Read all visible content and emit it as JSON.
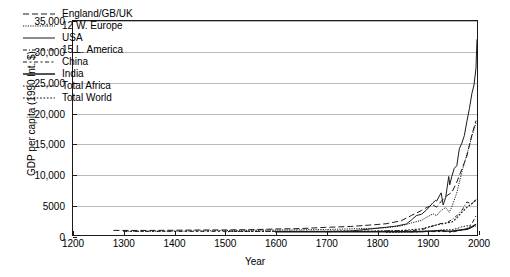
{
  "chart_data": {
    "type": "line",
    "title": "",
    "xlabel": "Year",
    "ylabel": "GDP per capita (1990 Int. $)",
    "xlim": [
      1200,
      2000
    ],
    "ylim": [
      0,
      35000
    ],
    "xticks": [
      1200,
      1300,
      1400,
      1500,
      1600,
      1700,
      1800,
      1900,
      2000
    ],
    "xticklabels": [
      "1200",
      "1300",
      "1400",
      "1500",
      "1600",
      "1700",
      "1800",
      "1900",
      "2000"
    ],
    "yticks": [
      0,
      5000,
      10000,
      15000,
      20000,
      25000,
      30000,
      35000
    ],
    "yticklabels": [
      "0",
      "5000",
      "10,000",
      "15,000",
      "20,000",
      "25,000",
      "30,000",
      "35,000"
    ],
    "grid": "horizontal",
    "legend_position": "top-left",
    "series": [
      {
        "name": "England/GB/UK",
        "style": "dashed",
        "x": [
          1280,
          1350,
          1400,
          1450,
          1500,
          1550,
          1600,
          1650,
          1700,
          1750,
          1800,
          1820,
          1850,
          1870,
          1890,
          1900,
          1913,
          1920,
          1929,
          1938,
          1945,
          1950,
          1960,
          1970,
          1980,
          1990,
          1998
        ],
        "values": [
          750,
          740,
          780,
          820,
          830,
          870,
          980,
          1050,
          1250,
          1400,
          1700,
          1840,
          2330,
          3190,
          4000,
          4490,
          4920,
          4550,
          5500,
          6270,
          6700,
          6940,
          8640,
          10770,
          12930,
          16430,
          18710
        ]
      },
      {
        "name": "12 W. Europe",
        "style": "dotted-fine",
        "x": [
          1300,
          1400,
          1500,
          1600,
          1700,
          1800,
          1820,
          1850,
          1870,
          1890,
          1900,
          1913,
          1920,
          1929,
          1938,
          1945,
          1950,
          1960,
          1970,
          1980,
          1990,
          1998
        ],
        "values": [
          600,
          620,
          730,
          800,
          900,
          1100,
          1200,
          1500,
          1960,
          2400,
          2890,
          3460,
          3150,
          4050,
          4500,
          3700,
          4570,
          6900,
          10300,
          13200,
          16200,
          18300
        ]
      },
      {
        "name": "USA",
        "style": "solid",
        "x": [
          1700,
          1750,
          1790,
          1820,
          1840,
          1860,
          1870,
          1880,
          1890,
          1900,
          1913,
          1918,
          1920,
          1929,
          1933,
          1938,
          1944,
          1946,
          1950,
          1955,
          1960,
          1965,
          1970,
          1975,
          1980,
          1985,
          1990,
          1994,
          1998,
          2000
        ],
        "values": [
          527,
          650,
          1000,
          1260,
          1450,
          1800,
          2445,
          3180,
          3390,
          4090,
          5300,
          5660,
          5550,
          6900,
          4910,
          6130,
          9570,
          8200,
          9560,
          10900,
          11330,
          14100,
          15030,
          16280,
          18580,
          20700,
          23200,
          24500,
          27300,
          32000
        ]
      },
      {
        "name": "15 L. America",
        "style": "dash-dot",
        "x": [
          1820,
          1850,
          1870,
          1890,
          1900,
          1913,
          1929,
          1938,
          1950,
          1960,
          1970,
          1980,
          1990,
          1998
        ],
        "values": [
          690,
          700,
          700,
          880,
          1100,
          1480,
          1900,
          1900,
          2510,
          3140,
          4040,
          5400,
          5050,
          5800
        ]
      },
      {
        "name": "China",
        "style": "dash-dot-dash",
        "x": [
          1300,
          1500,
          1700,
          1820,
          1850,
          1870,
          1890,
          1913,
          1929,
          1938,
          1950,
          1960,
          1970,
          1980,
          1990,
          1998
        ],
        "values": [
          600,
          600,
          600,
          600,
          600,
          530,
          540,
          552,
          562,
          562,
          439,
          662,
          778,
          1060,
          1870,
          3120
        ]
      },
      {
        "name": "India",
        "style": "solid-thick",
        "x": [
          1600,
          1700,
          1820,
          1850,
          1870,
          1890,
          1913,
          1929,
          1938,
          1950,
          1960,
          1970,
          1980,
          1990,
          1998
        ],
        "values": [
          550,
          550,
          533,
          533,
          533,
          580,
          673,
          728,
          668,
          619,
          753,
          868,
          938,
          1309,
          1746
        ]
      },
      {
        "name": "Total Africa",
        "style": "dotted",
        "x": [
          1820,
          1870,
          1890,
          1913,
          1929,
          1938,
          1950,
          1960,
          1970,
          1980,
          1990,
          1998
        ],
        "values": [
          420,
          500,
          560,
          637,
          780,
          850,
          852,
          1055,
          1335,
          1515,
          1425,
          1368
        ]
      },
      {
        "name": "Total World",
        "style": "dotted-coarse",
        "x": [
          1500,
          1600,
          1700,
          1820,
          1850,
          1870,
          1890,
          1913,
          1929,
          1938,
          1950,
          1960,
          1970,
          1980,
          1990,
          1998
        ],
        "values": [
          565,
          593,
          615,
          667,
          720,
          867,
          1000,
          1510,
          1800,
          1950,
          2110,
          2770,
          3730,
          4520,
          5150,
          5710
        ]
      }
    ]
  },
  "legend": {
    "items": [
      {
        "label": "England/GB/UK"
      },
      {
        "label": "12 W. Europe"
      },
      {
        "label": "USA"
      },
      {
        "label": "15 L. America"
      },
      {
        "label": "China"
      },
      {
        "label": "India"
      },
      {
        "label": "Total Africa"
      },
      {
        "label": "Total World"
      }
    ]
  }
}
